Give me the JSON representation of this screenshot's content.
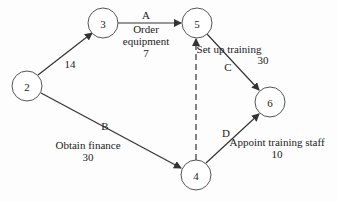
{
  "nodes": [
    {
      "id": "2",
      "label": "2",
      "x": 27,
      "y": 86
    },
    {
      "id": "3",
      "label": "3",
      "x": 103,
      "y": 23
    },
    {
      "id": "5",
      "label": "5",
      "x": 197,
      "y": 23
    },
    {
      "id": "6",
      "label": "6",
      "x": 270,
      "y": 102
    },
    {
      "id": "4",
      "label": "4",
      "x": 196,
      "y": 175
    }
  ],
  "edges": [
    {
      "from": "2",
      "to": "3",
      "letter": "",
      "name": "",
      "duration": "14"
    },
    {
      "from": "3",
      "to": "5",
      "letter": "A",
      "name_line1": "Order",
      "name_line2": "equipment",
      "duration": "7"
    },
    {
      "from": "5",
      "to": "6",
      "letter": "C",
      "name": "Set up training",
      "duration": "30"
    },
    {
      "from": "2",
      "to": "4",
      "letter": "B",
      "name": "Obtain finance",
      "duration": "30"
    },
    {
      "from": "4",
      "to": "6",
      "letter": "D",
      "name": "Appoint training staff",
      "duration": "10"
    },
    {
      "from": "4",
      "to": "5",
      "letter": "",
      "name": "",
      "duration": "",
      "dummy": true
    }
  ],
  "colors": {
    "line": "#333333",
    "node_stroke": "#555555",
    "text": "#222222"
  }
}
